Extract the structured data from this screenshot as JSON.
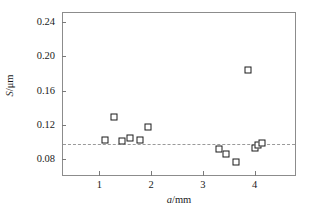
{
  "chart_data": {
    "type": "scatter",
    "title": "",
    "xlabel": "a/mm",
    "ylabel": "S/μm",
    "xlabel_italic_part": "a",
    "xlabel_rest": "/mm",
    "ylabel_italic_part": "S",
    "ylabel_rest": "/μm",
    "xlim": [
      0.28,
      4.8
    ],
    "ylim": [
      0.0605,
      0.2515
    ],
    "xticks": [
      1,
      2,
      3,
      4
    ],
    "xtick_labels": [
      "1",
      "2",
      "3",
      "4"
    ],
    "yticks": [
      0.08,
      0.12,
      0.16,
      0.2,
      0.24
    ],
    "ytick_labels": [
      "0.08",
      "0.12",
      "0.16",
      "0.20",
      "0.24"
    ],
    "grid": false,
    "legend": null,
    "marker": "open-square",
    "marker_color": "#1a1a1a",
    "frame_color": "#8c8c8c",
    "reference_line": {
      "type": "horizontal-dash-dot",
      "value": 0.099,
      "color": "#9a9a9a"
    },
    "points": [
      {
        "x": 1.1,
        "y": 0.1035
      },
      {
        "x": 1.26,
        "y": 0.1305
      },
      {
        "x": 1.42,
        "y": 0.1025
      },
      {
        "x": 1.58,
        "y": 0.1065
      },
      {
        "x": 1.76,
        "y": 0.1035
      },
      {
        "x": 1.92,
        "y": 0.1185
      },
      {
        "x": 3.29,
        "y": 0.0935
      },
      {
        "x": 3.43,
        "y": 0.0875
      },
      {
        "x": 3.63,
        "y": 0.0785
      },
      {
        "x": 3.85,
        "y": 0.185
      },
      {
        "x": 3.98,
        "y": 0.0945
      },
      {
        "x": 4.05,
        "y": 0.0975
      },
      {
        "x": 4.13,
        "y": 0.1005
      }
    ]
  }
}
